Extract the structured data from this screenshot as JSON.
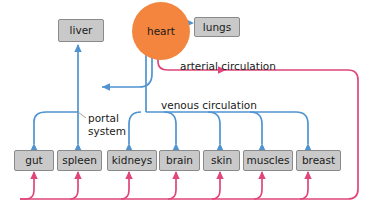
{
  "diagram": {
    "colors": {
      "organ_box_fill": "#c9c9c9",
      "organ_box_border": "#8a8a8a",
      "heart_fill": "#f4853f",
      "venous_blue": "#4f93d1",
      "arterial_pink": "#e0457b",
      "background": "#ffffff",
      "text": "#1a1a1a"
    },
    "nodes": {
      "heart": {
        "label": "heart",
        "shape": "circle"
      },
      "lungs": {
        "label": "lungs",
        "shape": "box"
      },
      "liver": {
        "label": "liver",
        "shape": "box"
      },
      "gut": {
        "label": "gut",
        "shape": "box"
      },
      "spleen": {
        "label": "spleen",
        "shape": "box"
      },
      "kidneys": {
        "label": "kidneys",
        "shape": "box"
      },
      "brain": {
        "label": "brain",
        "shape": "box"
      },
      "skin": {
        "label": "skin",
        "shape": "box"
      },
      "muscles": {
        "label": "muscles",
        "shape": "box"
      },
      "breast": {
        "label": "breast",
        "shape": "box"
      }
    },
    "annotations": {
      "arterial": "arterial circulation",
      "venous": "venous circulation",
      "portal_line1": "portal",
      "portal_line2": "system"
    }
  }
}
